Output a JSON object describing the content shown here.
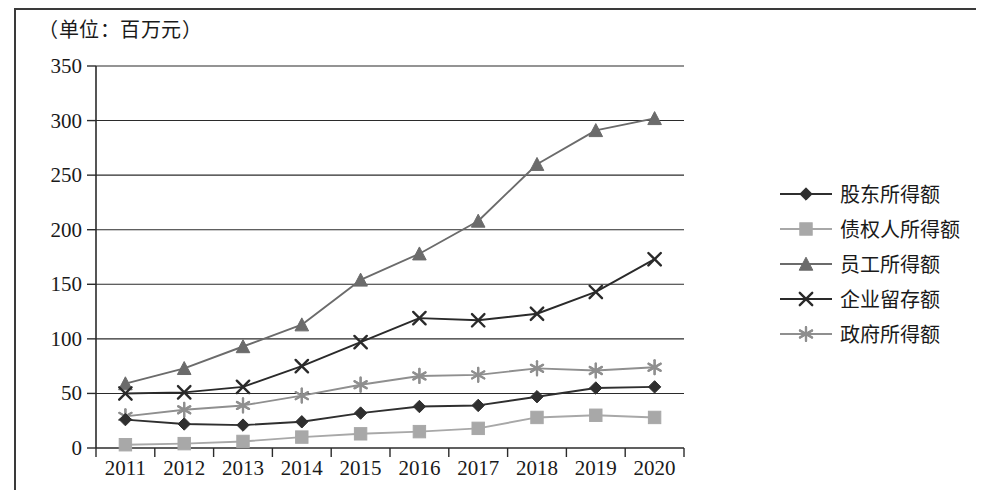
{
  "unit_title": "（单位：百万元）",
  "legend": {
    "items": [
      {
        "label": "股东所得额",
        "marker": "diamond-marker-icon",
        "color": "#2f2f2f"
      },
      {
        "label": "债权人所得额",
        "marker": "square-marker-icon",
        "color": "#a8a8a8"
      },
      {
        "label": "员工所得额",
        "marker": "triangle-marker-icon",
        "color": "#6b6b6b"
      },
      {
        "label": "企业留存额",
        "marker": "x-marker-icon",
        "color": "#2a2a2a"
      },
      {
        "label": "政府所得额",
        "marker": "asterisk-marker-icon",
        "color": "#8f8f8f"
      }
    ]
  },
  "axes": {
    "y_ticks": [
      "350",
      "300",
      "250",
      "200",
      "150",
      "100",
      "50",
      "0"
    ],
    "x_ticks": [
      "2011",
      "2012",
      "2013",
      "2014",
      "2015",
      "2016",
      "2017",
      "2018",
      "2019",
      "2020"
    ]
  },
  "chart_data": {
    "type": "line",
    "title": "（单位：百万元）",
    "xlabel": "",
    "ylabel": "",
    "unit": "百万元",
    "grid": true,
    "legend_position": "right",
    "ylim": [
      0,
      350
    ],
    "ytick_step": 50,
    "categories": [
      "2011",
      "2012",
      "2013",
      "2014",
      "2015",
      "2016",
      "2017",
      "2018",
      "2019",
      "2020"
    ],
    "series": [
      {
        "name": "股东所得额",
        "marker": "diamond",
        "color": "#2f2f2f",
        "values": [
          26,
          22,
          21,
          24,
          32,
          38,
          39,
          47,
          55,
          56
        ]
      },
      {
        "name": "债权人所得额",
        "marker": "square",
        "color": "#a8a8a8",
        "values": [
          3,
          4,
          6,
          10,
          13,
          15,
          18,
          28,
          30,
          28
        ]
      },
      {
        "name": "员工所得额",
        "marker": "triangle",
        "color": "#6b6b6b",
        "values": [
          59,
          73,
          93,
          113,
          154,
          178,
          208,
          260,
          291,
          302
        ]
      },
      {
        "name": "企业留存额",
        "marker": "x",
        "color": "#2a2a2a",
        "values": [
          50,
          51,
          56,
          75,
          97,
          119,
          117,
          123,
          143,
          173
        ]
      },
      {
        "name": "政府所得额",
        "marker": "asterisk",
        "color": "#8f8f8f",
        "values": [
          29,
          35,
          39,
          48,
          58,
          66,
          67,
          73,
          71,
          74
        ]
      }
    ]
  }
}
